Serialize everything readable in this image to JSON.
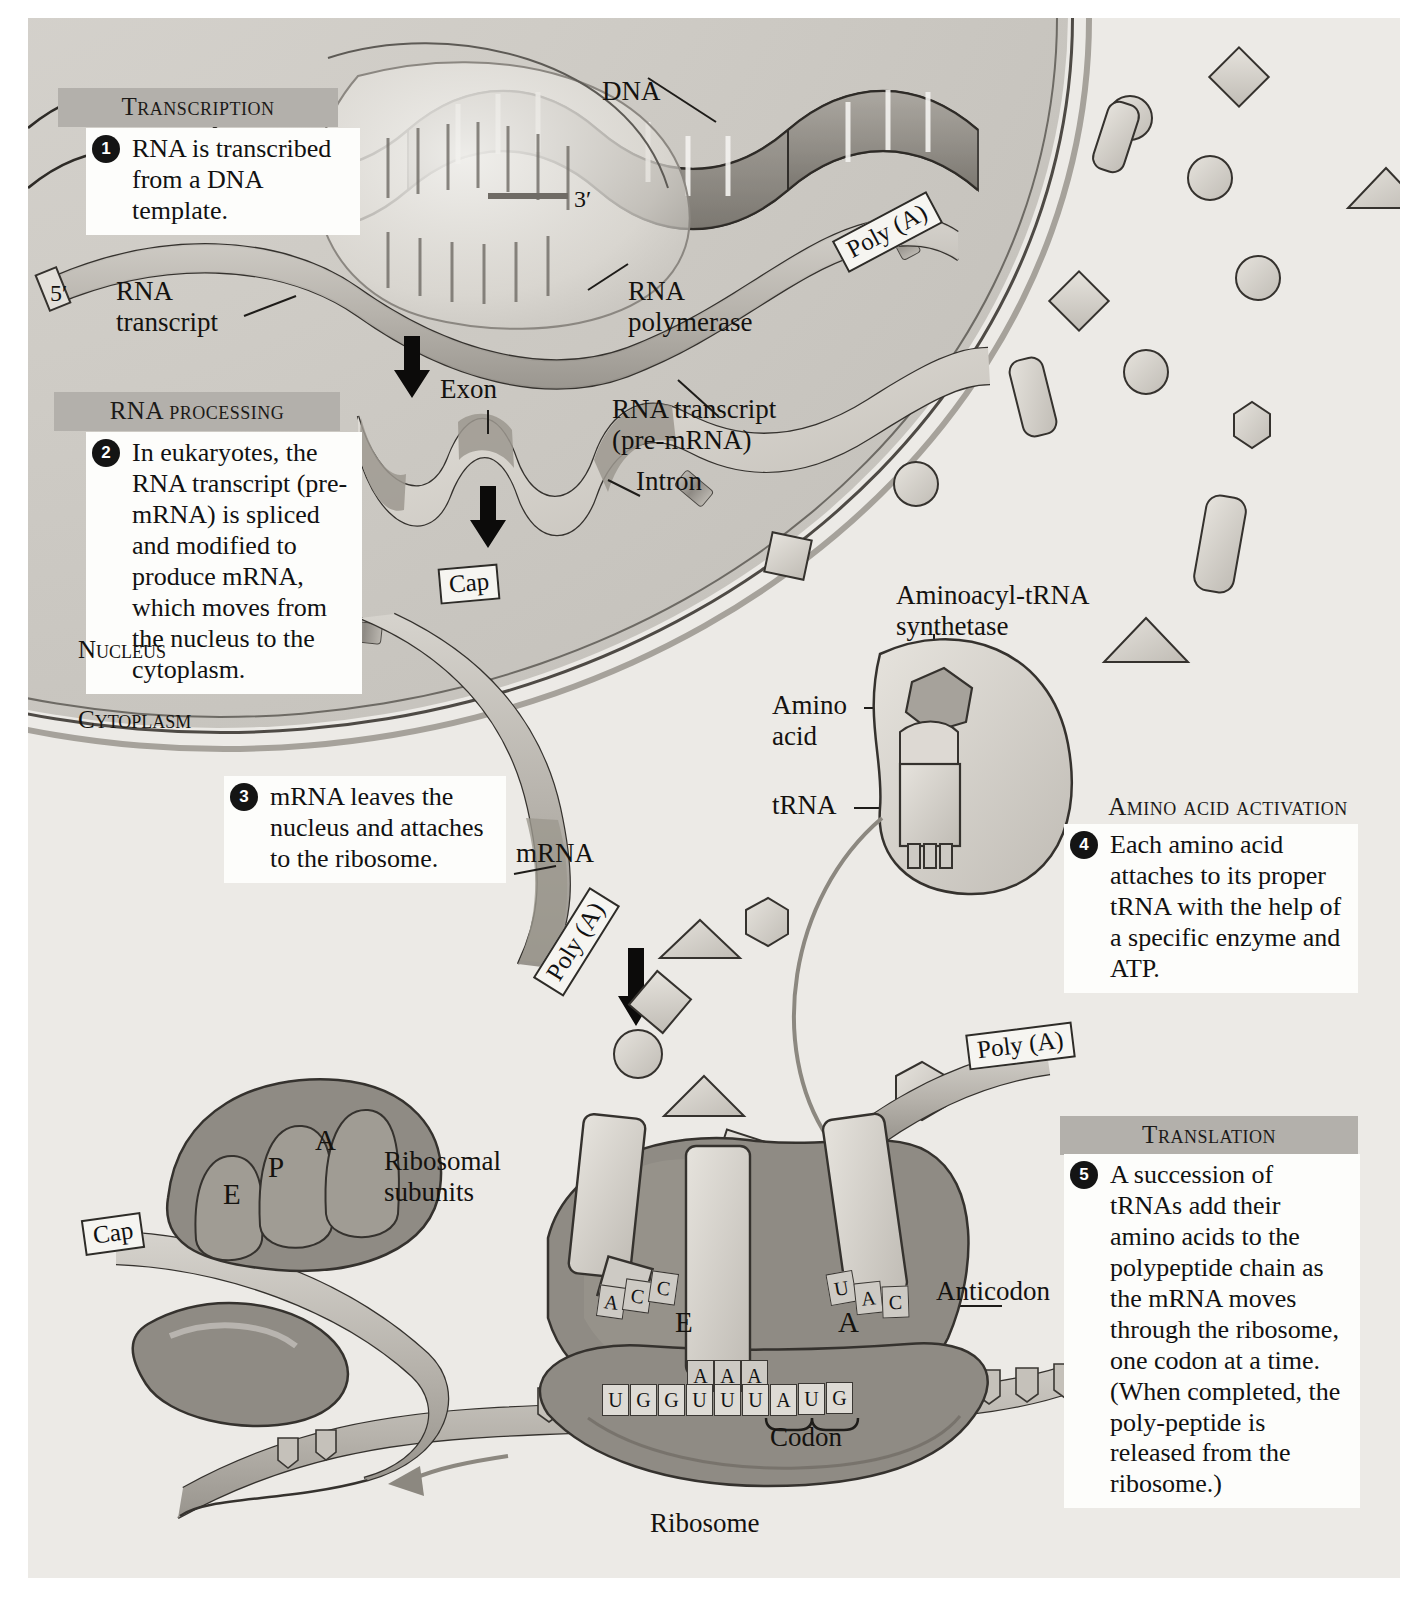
{
  "figure": {
    "title_sections": [
      {
        "id": "transcription",
        "label": "Transcription"
      },
      {
        "id": "rna-processing",
        "label": "RNA processing"
      },
      {
        "id": "amino-acid-activation",
        "label": "Amino acid activation"
      },
      {
        "id": "translation",
        "label": "Translation"
      }
    ],
    "steps": [
      {
        "number": "1",
        "text": "RNA is transcribed from a DNA template."
      },
      {
        "number": "2",
        "text": "In eukaryotes, the RNA transcript (pre-mRNA) is spliced and modified to produce mRNA, which moves from the nucleus to the cytoplasm."
      },
      {
        "number": "3",
        "text": "mRNA leaves the nucleus and attaches to the ribosome."
      },
      {
        "number": "4",
        "text": "Each amino acid attaches to its proper tRNA with the help of a specific enzyme and ATP."
      },
      {
        "number": "5",
        "text": "A succession of tRNAs add their amino acids to the polypeptide chain as the mRNA moves through the ribosome, one codon at a time. (When completed, the poly-peptide is released from the ribosome.)"
      }
    ],
    "compartments": [
      {
        "id": "nucleus",
        "label": "Nucleus"
      },
      {
        "id": "cytoplasm",
        "label": "Cytoplasm"
      }
    ],
    "labels": {
      "dna": "DNA",
      "rna_transcript": "RNA\ntranscript",
      "rna_polymerase": "RNA\npolymerase",
      "exon": "Exon",
      "intron": "Intron",
      "rna_transcript_premrna": "RNA transcript\n(pre-mRNA)",
      "mrna": "mRNA",
      "aminoacyl_trna_synthetase": "Aminoacyl-tRNA\nsynthetase",
      "amino_acid": "Amino\nacid",
      "trna": "tRNA",
      "ribosomal_subunits": "Ribosomal\nsubunits",
      "anticodon": "Anticodon",
      "codon": "Codon",
      "ribosome": "Ribosome",
      "five_prime": "5′",
      "three_prime": "3′"
    },
    "boxed_labels": {
      "cap": "Cap",
      "poly_a": "Poly (A)"
    },
    "ribosome_sites": {
      "subunit_e": "E",
      "subunit_p": "P",
      "subunit_a": "A",
      "assembled_e": "E",
      "assembled_a": "A"
    },
    "sequences": {
      "anticodon_left": [
        "A",
        "C",
        "C"
      ],
      "anticodon_middle": [
        "A",
        "A",
        "A"
      ],
      "anticodon_right": [
        "U",
        "A",
        "C"
      ],
      "mrna_codons": [
        "U",
        "G",
        "G",
        "U",
        "U",
        "U",
        "A",
        "U",
        "G"
      ]
    },
    "colors": {
      "plate_background": "#eceae6",
      "nucleus_fill": "#cfccc6",
      "header_band": "#b3b0ab",
      "callout_background": "#fdfdfb",
      "ribbon_fill": "#b9b6b0",
      "ink": "#14120f",
      "ribosome_dark": "#8c8881",
      "ribosome_light": "#b5b1aa"
    }
  }
}
